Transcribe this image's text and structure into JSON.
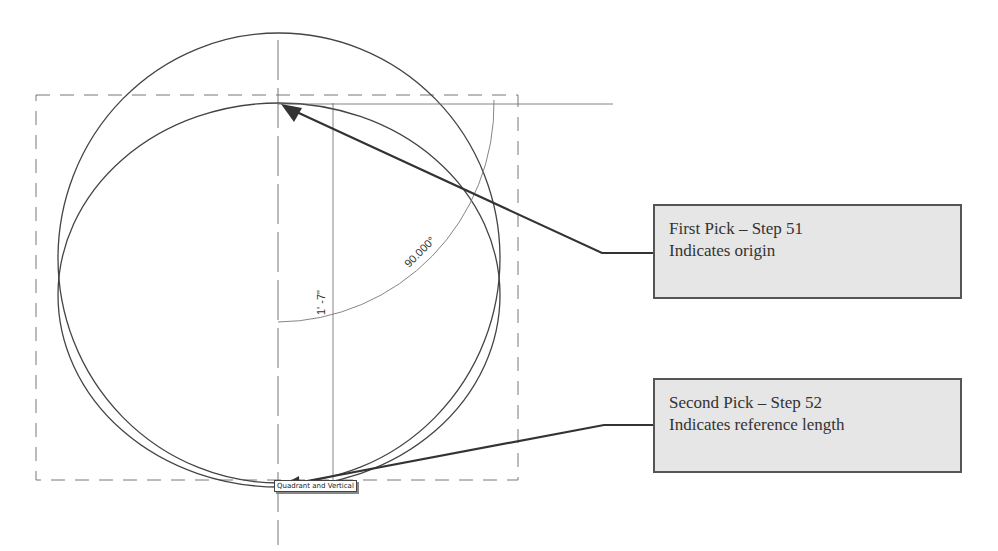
{
  "callouts": [
    {
      "title": "First Pick – Step 51",
      "desc": "Indicates origin"
    },
    {
      "title": "Second Pick – Step 52",
      "desc": "Indicates reference length"
    }
  ],
  "dimensions": {
    "linear": "1' -7\"",
    "angular": "90.000°"
  },
  "snap_tooltip": "Quadrant and Vertical",
  "colors": {
    "callout_bg": "#e6e6e6",
    "callout_border": "#555555",
    "line": "#444444",
    "dashed": "#777777"
  }
}
